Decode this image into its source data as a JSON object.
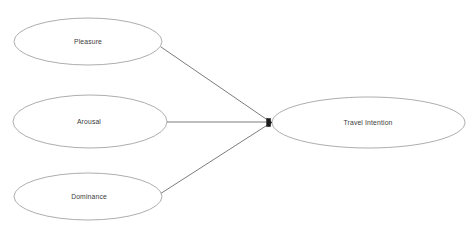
{
  "diagram": {
    "background_color": "#ffffff",
    "node_stroke_color": "#8a8a8a",
    "edge_color": "#5a5a5a",
    "label_color": "#3a3a3a",
    "marker_color": "#1d1d1d",
    "nodes": [
      {
        "id": "pleasure",
        "label": "Pleasure",
        "shape": "ellipse",
        "cx": 88,
        "cy": 41.5,
        "rx": 74,
        "ry": 23.5
      },
      {
        "id": "arousal",
        "label": "Arousal",
        "shape": "ellipse",
        "cx": 90,
        "cy": 121.5,
        "rx": 77,
        "ry": 26.5
      },
      {
        "id": "dominance",
        "label": "Dominance",
        "shape": "ellipse",
        "cx": 88,
        "cy": 196.5,
        "rx": 74,
        "ry": 23.5
      },
      {
        "id": "travel_intention",
        "label": "Travel Intention",
        "shape": "ellipse",
        "cx": 368.5,
        "cy": 122.5,
        "rx": 96.5,
        "ry": 25.5
      }
    ],
    "edges": [
      {
        "id": "pleasure-to-travel-intention",
        "from": "pleasure",
        "to": "travel_intention",
        "x1": 161,
        "y1": 47,
        "x2": 269,
        "y2": 121,
        "arrow": true
      },
      {
        "id": "arousal-to-travel-intention",
        "from": "arousal",
        "to": "travel_intention",
        "x1": 166,
        "y1": 122,
        "x2": 269,
        "y2": 122,
        "arrow": true
      },
      {
        "id": "dominance-to-travel-intention",
        "from": "dominance",
        "to": "travel_intention",
        "x1": 160,
        "y1": 194,
        "x2": 269,
        "y2": 124,
        "arrow": true
      }
    ],
    "arrow_marker": {
      "id": "convergence-arrowhead",
      "x": 270,
      "y": 122.5,
      "width": 5,
      "height": 9
    }
  }
}
